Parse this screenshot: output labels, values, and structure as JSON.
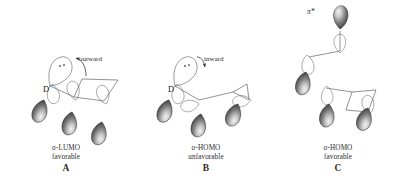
{
  "figure": {
    "background_color": "#ffffff",
    "line_color": "#4a4a4a",
    "lobe_fill_dark": "#3a3a3a",
    "lobe_fill_light": "#e8e8e8",
    "lobe_stroke": "#2b2b2b",
    "empty_lobe_stroke": "#5a5a5a",
    "text_color": "#2a2a2a"
  },
  "structures": [
    {
      "id": "A",
      "letter": "A",
      "orbital_label": "σ-LUMO",
      "assessment": "favorable",
      "rotation_annotation": "outward",
      "donor_atom_label": "D",
      "lone_pair_dots": 2,
      "filled_lobe_count": 3,
      "empty_lobe_count": 3,
      "arrow_direction": "left",
      "pi_star_label": null
    },
    {
      "id": "B",
      "letter": "B",
      "orbital_label": "σ-HOMO",
      "assessment": "unfavorable",
      "rotation_annotation": "inward",
      "donor_atom_label": "D",
      "lone_pair_dots": 2,
      "filled_lobe_count": 3,
      "empty_lobe_count": 3,
      "arrow_direction": "right",
      "pi_star_label": null
    },
    {
      "id": "C",
      "letter": "C",
      "orbital_label": "σ-HOMO",
      "assessment": "favorable",
      "rotation_annotation": null,
      "donor_atom_label": null,
      "lone_pair_dots": 0,
      "filled_lobe_count": 4,
      "empty_lobe_count": 4,
      "arrow_direction": null,
      "pi_star_label": "π*"
    }
  ]
}
